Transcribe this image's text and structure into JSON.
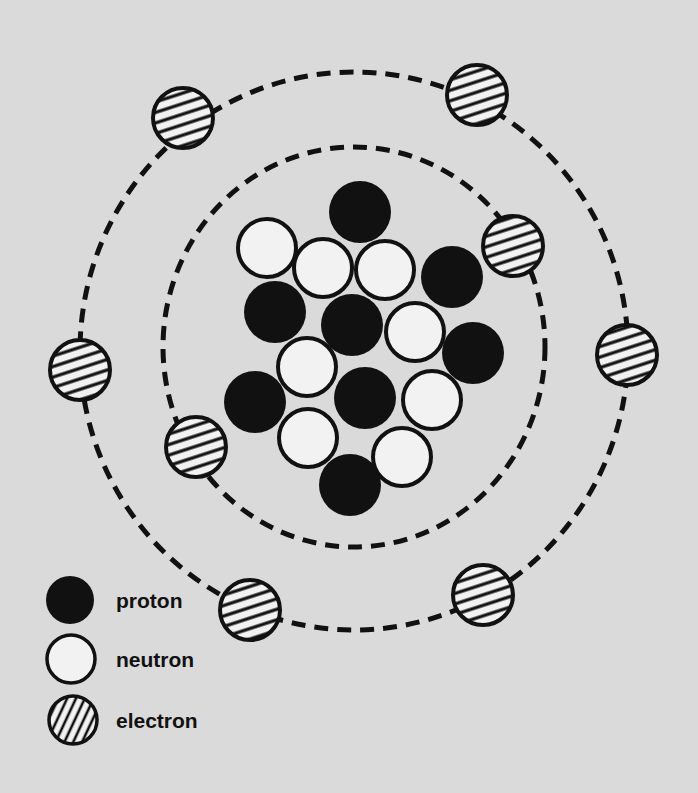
{
  "colors": {
    "background": "#dadada",
    "ink": "#111111",
    "neutron_fill": "#f2f2f2"
  },
  "orbits": [
    {
      "name": "inner-orbit",
      "cx": 354,
      "cy": 347,
      "rx": 191,
      "ry": 200
    },
    {
      "name": "outer-orbit",
      "cx": 354,
      "cy": 351,
      "rx": 274,
      "ry": 279
    }
  ],
  "particle_radius": 30,
  "nucleus": {
    "protons": [
      [
        360,
        212
      ],
      [
        452,
        277
      ],
      [
        275,
        312
      ],
      [
        352,
        325
      ],
      [
        473,
        353
      ],
      [
        255,
        402
      ],
      [
        365,
        398
      ],
      [
        350,
        485
      ]
    ],
    "neutrons": [
      [
        267,
        248
      ],
      [
        323,
        268
      ],
      [
        385,
        270
      ],
      [
        415,
        332
      ],
      [
        307,
        367
      ],
      [
        432,
        400
      ],
      [
        308,
        438
      ],
      [
        402,
        457
      ]
    ]
  },
  "electrons": {
    "inner": [
      [
        513,
        246
      ],
      [
        196,
        447
      ]
    ],
    "outer": [
      [
        183,
        118
      ],
      [
        477,
        95
      ],
      [
        627,
        355
      ],
      [
        80,
        370
      ],
      [
        250,
        610
      ],
      [
        483,
        595
      ]
    ]
  },
  "legend": {
    "items": [
      {
        "kind": "proton",
        "label": "proton",
        "cx": 70,
        "cy": 600
      },
      {
        "kind": "neutron",
        "label": "neutron",
        "cx": 71,
        "cy": 659
      },
      {
        "kind": "electron",
        "label": "electron",
        "cx": 73,
        "cy": 720
      }
    ],
    "radius": 24
  }
}
